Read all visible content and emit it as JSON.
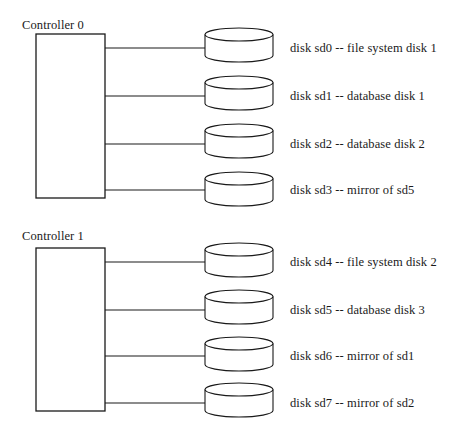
{
  "diagram": {
    "background_color": "#ffffff",
    "line_color": "#1a1a1a",
    "groups": [
      {
        "id": "controller-0",
        "caption": "Controller 0",
        "caption_x": 22,
        "caption_y": 18,
        "box": {
          "x": 36,
          "y": 34,
          "width": 69,
          "height": 164
        },
        "disks": [
          {
            "id": "sd0",
            "label": "disk sd0 -- file system disk 1",
            "cylinder": {
              "x": 205,
              "y": 28,
              "width": 68,
              "height": 34
            },
            "link_y": 48,
            "label_x": 290
          },
          {
            "id": "sd1",
            "label": "disk sd1 -- database disk 1",
            "cylinder": {
              "x": 205,
              "y": 76,
              "width": 68,
              "height": 34
            },
            "link_y": 96,
            "label_x": 290
          },
          {
            "id": "sd2",
            "label": "disk sd2 -- database disk 2",
            "cylinder": {
              "x": 205,
              "y": 124,
              "width": 68,
              "height": 34
            },
            "link_y": 144,
            "label_x": 290
          },
          {
            "id": "sd3",
            "label": "disk sd3 -- mirror of sd5",
            "cylinder": {
              "x": 205,
              "y": 172,
              "width": 68,
              "height": 34
            },
            "link_y": 190,
            "label_x": 290
          }
        ]
      },
      {
        "id": "controller-1",
        "caption": "Controller 1",
        "caption_x": 22,
        "caption_y": 229,
        "box": {
          "x": 36,
          "y": 248,
          "width": 69,
          "height": 163
        },
        "disks": [
          {
            "id": "sd4",
            "label": "disk sd4 -- file system disk 2",
            "cylinder": {
              "x": 205,
              "y": 243,
              "width": 68,
              "height": 34
            },
            "link_y": 262,
            "label_x": 290
          },
          {
            "id": "sd5",
            "label": "disk sd5 -- database disk 3",
            "cylinder": {
              "x": 205,
              "y": 290,
              "width": 68,
              "height": 34
            },
            "link_y": 310,
            "label_x": 290
          },
          {
            "id": "sd6",
            "label": "disk sd6 -- mirror of sd1",
            "cylinder": {
              "x": 205,
              "y": 337,
              "width": 68,
              "height": 34
            },
            "link_y": 356,
            "label_x": 290
          },
          {
            "id": "sd7",
            "label": "disk sd7 -- mirror of sd2",
            "cylinder": {
              "x": 205,
              "y": 383,
              "width": 68,
              "height": 34
            },
            "link_y": 403,
            "label_x": 290
          }
        ]
      }
    ]
  }
}
